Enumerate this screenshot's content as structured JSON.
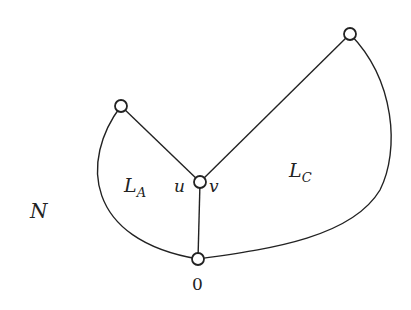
{
  "diagram": {
    "labels": {
      "region_left": {
        "main": "L",
        "sub": "A"
      },
      "region_right": {
        "main": "L",
        "sub": "C"
      },
      "outer": "N",
      "center_left": "u",
      "center_right": "v",
      "bottom_node": "0"
    },
    "nodes": [
      {
        "id": "left-top",
        "x": 121,
        "y": 106
      },
      {
        "id": "right-top",
        "x": 350,
        "y": 34
      },
      {
        "id": "center",
        "x": 200,
        "y": 182
      },
      {
        "id": "bottom",
        "x": 198,
        "y": 259
      }
    ],
    "edges": [
      {
        "from": "left-top",
        "to": "center",
        "type": "straight"
      },
      {
        "from": "right-top",
        "to": "center",
        "type": "straight"
      },
      {
        "from": "center",
        "to": "bottom",
        "type": "straight"
      },
      {
        "from": "left-top",
        "to": "bottom",
        "type": "curve"
      },
      {
        "from": "right-top",
        "to": "bottom",
        "type": "curve"
      }
    ],
    "colors": {
      "stroke": "#222222",
      "background": "#ffffff"
    }
  }
}
